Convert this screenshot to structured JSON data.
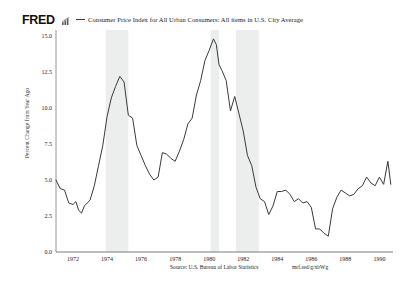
{
  "header": {
    "logo_text": "FRED",
    "logo_icon": "bar-chart-icon",
    "legend_dash": "series-line-swatch",
    "legend_label": "Consumer Price Index for All Urban Consumers: All items in U.S. City Average"
  },
  "footer": {
    "source": "Source: U.S. Bureau of Labor Statistics",
    "short_url": "mrf.red/g/xbWg"
  },
  "colors": {
    "line": "#3a3a3a",
    "recession_band": "#eceded",
    "axis": "#7a7a7a",
    "text": "#1d1d1d",
    "background": "#ffffff"
  },
  "chart_data": {
    "type": "line",
    "title": "Consumer Price Index for All Urban Consumers: All items in U.S. City Average",
    "xlabel": "",
    "ylabel": "Percent Change from Year Ago",
    "xlim": [
      1971.0,
      1990.8
    ],
    "ylim": [
      0.0,
      15.0
    ],
    "grid": false,
    "legend_position": "top",
    "ytick_labels": [
      "0.0",
      "2.5",
      "5.0",
      "7.5",
      "10.0",
      "12.5",
      "15.0"
    ],
    "ytick_values": [
      0.0,
      2.5,
      5.0,
      7.5,
      10.0,
      12.5,
      15.0
    ],
    "xtick_labels": [
      "1972",
      "1974",
      "1976",
      "1978",
      "1980",
      "1982",
      "1984",
      "1986",
      "1988",
      "1990"
    ],
    "xtick_values": [
      1972,
      1974,
      1976,
      1978,
      1980,
      1982,
      1984,
      1986,
      1988,
      1990
    ],
    "recession_bands": [
      {
        "start": 1973.92,
        "end": 1975.25
      },
      {
        "start": 1980.08,
        "end": 1980.58
      },
      {
        "start": 1981.58,
        "end": 1982.92
      }
    ],
    "series": [
      {
        "name": "Consumer Price Index for All Urban Consumers: All items in U.S. City Average",
        "x": [
          1971.0,
          1971.25,
          1971.5,
          1971.75,
          1972.0,
          1972.17,
          1972.33,
          1972.5,
          1972.67,
          1972.83,
          1973.0,
          1973.25,
          1973.5,
          1973.75,
          1974.0,
          1974.25,
          1974.5,
          1974.75,
          1975.0,
          1975.25,
          1975.5,
          1975.75,
          1976.0,
          1976.25,
          1976.5,
          1976.75,
          1977.0,
          1977.25,
          1977.5,
          1977.75,
          1978.0,
          1978.25,
          1978.5,
          1978.75,
          1979.0,
          1979.25,
          1979.5,
          1979.75,
          1980.0,
          1980.25,
          1980.42,
          1980.58,
          1980.75,
          1981.0,
          1981.25,
          1981.5,
          1981.75,
          1982.0,
          1982.25,
          1982.5,
          1982.75,
          1983.0,
          1983.25,
          1983.5,
          1983.75,
          1984.0,
          1984.25,
          1984.5,
          1984.75,
          1985.0,
          1985.25,
          1985.5,
          1985.75,
          1986.0,
          1986.25,
          1986.5,
          1986.75,
          1987.0,
          1987.25,
          1987.5,
          1987.75,
          1988.0,
          1988.25,
          1988.5,
          1988.75,
          1989.0,
          1989.25,
          1989.5,
          1989.75,
          1990.0,
          1990.25,
          1990.5,
          1990.67
        ],
        "y": [
          5.0,
          4.4,
          4.3,
          3.4,
          3.3,
          3.5,
          2.9,
          2.7,
          3.2,
          3.4,
          3.6,
          4.6,
          6.0,
          7.4,
          9.4,
          10.7,
          11.5,
          12.2,
          11.8,
          9.5,
          9.3,
          7.4,
          6.7,
          6.0,
          5.4,
          5.0,
          5.2,
          6.9,
          6.8,
          6.5,
          6.3,
          7.0,
          7.8,
          8.9,
          9.3,
          10.9,
          11.9,
          13.3,
          14.0,
          14.8,
          14.4,
          13.0,
          12.6,
          11.9,
          9.8,
          10.8,
          9.6,
          8.4,
          6.7,
          6.0,
          4.5,
          3.7,
          3.5,
          2.6,
          3.2,
          4.2,
          4.2,
          4.3,
          4.0,
          3.5,
          3.7,
          3.4,
          3.5,
          3.1,
          1.6,
          1.6,
          1.3,
          1.1,
          3.0,
          3.8,
          4.3,
          4.1,
          3.9,
          4.0,
          4.4,
          4.6,
          5.2,
          4.8,
          4.6,
          5.2,
          4.7,
          6.3,
          4.7
        ]
      }
    ]
  }
}
